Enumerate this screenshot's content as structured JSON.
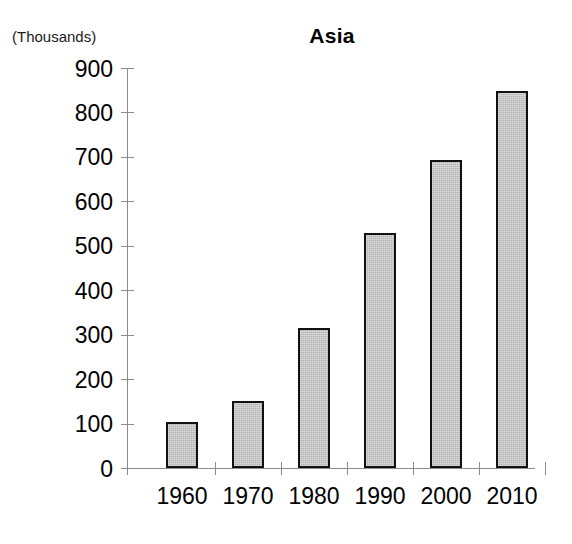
{
  "chart_data": {
    "type": "bar",
    "title": "Asia",
    "unit_label": "(Thousands)",
    "xlabel": "",
    "ylabel": "",
    "categories": [
      "1960",
      "1970",
      "1980",
      "1990",
      "2000",
      "2010"
    ],
    "values": [
      103,
      150,
      314,
      528,
      694,
      848
    ],
    "ylim": [
      0,
      900
    ],
    "ytick_values": [
      0,
      100,
      200,
      300,
      400,
      500,
      600,
      700,
      800,
      900
    ],
    "ytick_labels": [
      "0",
      "100",
      "200",
      "300",
      "400",
      "500",
      "600",
      "700",
      "800",
      "900"
    ],
    "grid": false,
    "legend": null,
    "series": [
      {
        "name": "Asia",
        "values": [
          103,
          150,
          314,
          528,
          694,
          848
        ]
      }
    ],
    "colors": {
      "bar_fill": "#b3b3b3",
      "bar_border": "#111111",
      "axis": "#8c8c8c",
      "text": "#000000",
      "background": "#ffffff"
    }
  }
}
